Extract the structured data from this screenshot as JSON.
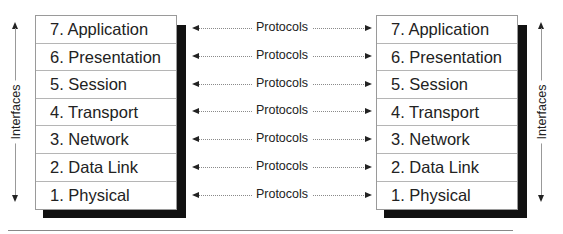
{
  "diagram": {
    "left_stack": {
      "layers": [
        "7. Application",
        "6. Presentation",
        "5. Session",
        "4. Transport",
        "3. Network",
        "2. Data Link",
        "1. Physical"
      ]
    },
    "right_stack": {
      "layers": [
        "7. Application",
        "6. Presentation",
        "5. Session",
        "4. Transport",
        "3. Network",
        "2. Data Link",
        "1. Physical"
      ]
    },
    "protocols": [
      "Protocols",
      "Protocols",
      "Protocols",
      "Protocols",
      "Protocols",
      "Protocols",
      "Protocols"
    ],
    "interfaces_left": "Interfaces",
    "interfaces_right": "Interfaces",
    "colors": {
      "shadow": "#111111",
      "box_border": "#9a9a9a",
      "text": "#222222",
      "connector": "#8a8a8a"
    }
  }
}
